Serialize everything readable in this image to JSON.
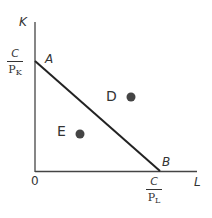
{
  "diagram": {
    "type": "isocost-line",
    "axes": {
      "y_label": "K",
      "x_label": "L",
      "origin_label": "0"
    },
    "intercepts": {
      "y": {
        "point": "A",
        "numerator": "C",
        "denominator_base": "P",
        "denominator_sub": "K"
      },
      "x": {
        "point": "B",
        "numerator": "C",
        "denominator_base": "P",
        "denominator_sub": "L"
      }
    },
    "points": [
      {
        "label": "D",
        "position": "above line"
      },
      {
        "label": "E",
        "position": "below line"
      }
    ],
    "colors": {
      "axis": "#444444",
      "line": "#222222",
      "dot": "#444444",
      "text": "#333333"
    }
  }
}
